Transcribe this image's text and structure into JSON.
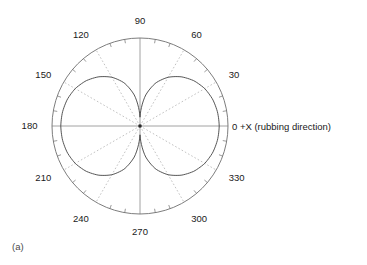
{
  "figure": {
    "panel_label": "(a)",
    "zero_axis_label": "0 +X (rubbing direction)",
    "colors": {
      "outer_circle": "#6e6e6e",
      "grid_dotted": "#a8a8a8",
      "axis_line": "#8c8c8c",
      "curve": "#4d4d4d",
      "tick": "#7a7a7a",
      "center_dot": "#2b2b2b",
      "text": "#1a1a1a",
      "background": "#ffffff"
    },
    "geometry": {
      "center_x": 140,
      "center_y": 126,
      "radius": 88,
      "tick_step_deg": 10,
      "label_step_deg": 30
    },
    "angle_labels": [
      {
        "deg": 0,
        "text": "0"
      },
      {
        "deg": 30,
        "text": "30"
      },
      {
        "deg": 60,
        "text": "60"
      },
      {
        "deg": 90,
        "text": "90"
      },
      {
        "deg": 120,
        "text": "120"
      },
      {
        "deg": 150,
        "text": "150"
      },
      {
        "deg": 180,
        "text": "180"
      },
      {
        "deg": 210,
        "text": "210"
      },
      {
        "deg": 240,
        "text": "240"
      },
      {
        "deg": 270,
        "text": "270"
      },
      {
        "deg": 300,
        "text": "300"
      },
      {
        "deg": 330,
        "text": "330"
      }
    ]
  },
  "chart_data": {
    "type": "line",
    "subtype": "polar",
    "title": "",
    "panel": "(a)",
    "xlabel": "",
    "ylabel": "",
    "angle_unit": "degrees",
    "angle_direction": "counterclockwise",
    "zero_angle_position": "east",
    "rlim": [
      0,
      1
    ],
    "rmax_radius_px": 88,
    "grid": true,
    "grid_angles_deg": [
      0,
      30,
      60,
      90,
      120,
      150,
      180,
      210,
      240,
      270,
      300,
      330
    ],
    "tick_angles_step_deg": 10,
    "legend": "none",
    "annotations": [
      {
        "text": "+X (rubbing direction)",
        "at_deg": 0
      },
      {
        "text": "(a)",
        "position": "bottom-left"
      }
    ],
    "series": [
      {
        "name": "intensity",
        "description": "Two-lobed (figure-eight) angular intensity distribution, maxima along 0 and 180 degrees, minima along 90 and 270 degrees",
        "theta": [
          0,
          10,
          20,
          30,
          40,
          50,
          60,
          70,
          80,
          90,
          100,
          110,
          120,
          130,
          140,
          150,
          160,
          170,
          180,
          190,
          200,
          210,
          220,
          230,
          240,
          250,
          260,
          270,
          280,
          290,
          300,
          310,
          320,
          330,
          340,
          350,
          360
        ],
        "r": [
          0.9,
          0.895,
          0.88,
          0.85,
          0.8,
          0.73,
          0.64,
          0.52,
          0.35,
          0.1,
          0.35,
          0.52,
          0.64,
          0.73,
          0.8,
          0.85,
          0.88,
          0.895,
          0.9,
          0.895,
          0.88,
          0.85,
          0.8,
          0.73,
          0.64,
          0.52,
          0.35,
          0.1,
          0.35,
          0.52,
          0.64,
          0.73,
          0.8,
          0.85,
          0.88,
          0.895,
          0.9
        ]
      }
    ]
  }
}
